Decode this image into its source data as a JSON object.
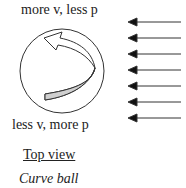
{
  "labels": {
    "top": "more v, less p",
    "bottom": "less v, more p",
    "view": "Top view",
    "caption": "Curve ball"
  },
  "diagram": {
    "ball": {
      "cx": 62,
      "cy": 71,
      "r": 42
    },
    "spin_arrow_fill": "#cfcfcf",
    "airflow_arrows_y": [
      22,
      38,
      54,
      70,
      86,
      102,
      118
    ],
    "airflow_x_start": 181,
    "airflow_x_end": 128
  },
  "colors": {
    "stroke": "#333333",
    "background": "#ffffff"
  }
}
